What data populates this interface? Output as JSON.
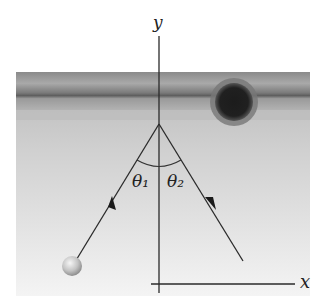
{
  "diagram": {
    "axes": {
      "x_label": "x",
      "y_label": "y"
    },
    "angles": {
      "theta1": "θ₁",
      "theta2": "θ₂"
    },
    "colors": {
      "wall_dark": "#6e6e6e",
      "wall_light": "#a8a8a8",
      "panel_top": "#bdbdbd",
      "panel_bottom": "#f2f2f2",
      "hole": "#1a1a1a",
      "ball": "#cfcfcf",
      "line": "#2a2a2a"
    }
  }
}
